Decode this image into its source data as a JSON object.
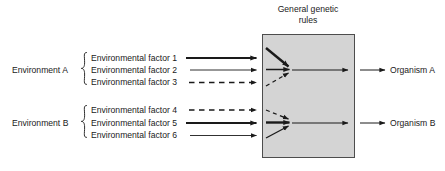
{
  "diagram": {
    "box": {
      "label_line1": "General genetic",
      "label_line2": "rules",
      "fill_color": "#d4d4d4",
      "stroke_color": "#4d4d4d"
    },
    "groups": [
      {
        "id": "group-a",
        "env_label": "Environment A",
        "organism_label": "Organism A",
        "factors": [
          {
            "label": "Environmental factor 1",
            "line_style": "thick-solid"
          },
          {
            "label": "Environmental factor 2",
            "line_style": "thin-solid"
          },
          {
            "label": "Environmental factor 3",
            "line_style": "dashed"
          }
        ]
      },
      {
        "id": "group-b",
        "env_label": "Environment B",
        "organism_label": "Organism B",
        "factors": [
          {
            "label": "Environmental factor 4",
            "line_style": "dashed"
          },
          {
            "label": "Environmental factor 5",
            "line_style": "thick-solid"
          },
          {
            "label": "Environmental factor 6",
            "line_style": "thin-solid"
          }
        ]
      }
    ],
    "colors": {
      "ink": "#1a1a1a",
      "background": "#ffffff"
    }
  }
}
